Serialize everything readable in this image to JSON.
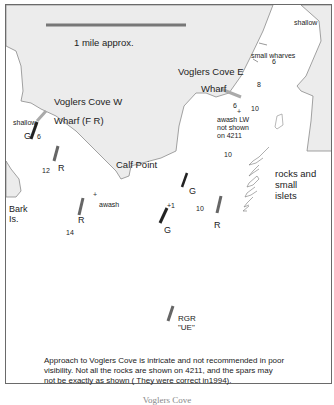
{
  "scale": {
    "label": "1 mile approx."
  },
  "places": {
    "voglers_cove_w": "Voglers Cove W",
    "wharf_fr": "Wharf (F R)",
    "voglers_cove_e": "Voglers Cove E",
    "wharf": "Wharf",
    "calf_point": "Calf Point",
    "bark_is_line1": "Bark",
    "bark_is_line2": "Is.",
    "small_wharves": "small wharves",
    "shallow_ne": "shallow",
    "shallow_w": "shallow",
    "rocks_line1": "rocks and",
    "rocks_line2": "small",
    "rocks_line3": "islets",
    "awash": "awash",
    "awash_lw_line1": "awash LW",
    "awash_lw_line2": "not shown",
    "awash_lw_line3": "on 4211"
  },
  "soundings": {
    "s6_w": "6",
    "s12": "12",
    "s14": "14",
    "s6_e": "6",
    "s8": "8",
    "s6_rock": "6",
    "s10_a": "10",
    "s10_b": "10",
    "s10_c": "10",
    "plus1": "+1"
  },
  "spars": [
    {
      "id": "g1",
      "label": "G"
    },
    {
      "id": "r1",
      "label": "R"
    },
    {
      "id": "r2",
      "label": "R"
    },
    {
      "id": "g2",
      "label": "G"
    },
    {
      "id": "g3",
      "label": "G"
    },
    {
      "id": "r3",
      "label": "R"
    },
    {
      "id": "rgr",
      "label": "RGR",
      "name": "\"UE\""
    }
  ],
  "note": {
    "line1": "Approach to Voglers Cove is intricate and not recommended in poor",
    "line2": "visibility. Not all the rocks are shown on 4211, and the spars may",
    "line3": " not be exactly as shown ( They were correct in1994)."
  },
  "caption": "Voglers Cove",
  "colors": {
    "land": "#ececec",
    "coast": "#8a8a8a",
    "spar_dark": "#222222",
    "spar_grey": "#666666",
    "scalebar": "#777777"
  }
}
